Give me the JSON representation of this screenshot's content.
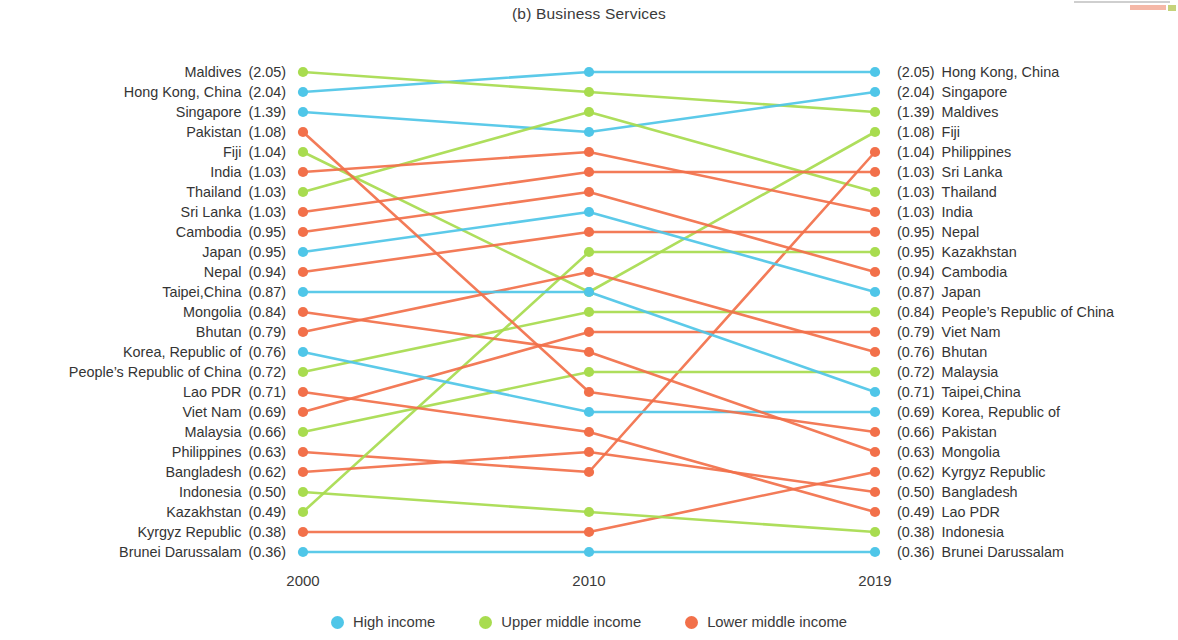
{
  "title": "(b) Business Services",
  "axis": {
    "years": [
      "2000",
      "2010",
      "2019"
    ],
    "x_positions": [
      303,
      589,
      875
    ]
  },
  "colors": {
    "high_income": "#4FC6E8",
    "upper_middle_income": "#A8DC4F",
    "lower_middle_income": "#F2704A",
    "text": "#3a3a3a"
  },
  "legend": {
    "items": [
      {
        "label": "High income",
        "color_key": "high_income",
        "dot_name": "legend-dot-high-income"
      },
      {
        "label": "Upper middle income",
        "color_key": "upper_middle_income",
        "dot_name": "legend-dot-upper-middle-income"
      },
      {
        "label": "Lower middle income",
        "color_key": "lower_middle_income",
        "dot_name": "legend-dot-lower-middle-income"
      }
    ]
  },
  "chart_data": {
    "type": "line",
    "chart_style": "slope-bump-chart",
    "title": "(b) Business Services",
    "xlabel": "",
    "ylabel": "",
    "categories": [
      "2000",
      "2010",
      "2019"
    ],
    "grid": false,
    "legend_position": "bottom",
    "y_axis": "rank order (1 = top row)",
    "left_column_header": "2000 value and economy",
    "right_column_header": "2019 value and economy",
    "left_rank_list": [
      {
        "rank": 1,
        "name": "Maldives",
        "value": "2.05",
        "group": "upper_middle_income"
      },
      {
        "rank": 2,
        "name": "Hong Kong, China",
        "value": "2.04",
        "group": "high_income"
      },
      {
        "rank": 3,
        "name": "Singapore",
        "value": "1.39",
        "group": "high_income"
      },
      {
        "rank": 4,
        "name": "Pakistan",
        "value": "1.08",
        "group": "lower_middle_income"
      },
      {
        "rank": 5,
        "name": "Fiji",
        "value": "1.04",
        "group": "upper_middle_income"
      },
      {
        "rank": 6,
        "name": "India",
        "value": "1.03",
        "group": "lower_middle_income"
      },
      {
        "rank": 7,
        "name": "Thailand",
        "value": "1.03",
        "group": "upper_middle_income"
      },
      {
        "rank": 8,
        "name": "Sri Lanka",
        "value": "1.03",
        "group": "lower_middle_income"
      },
      {
        "rank": 9,
        "name": "Cambodia",
        "value": "0.95",
        "group": "lower_middle_income"
      },
      {
        "rank": 10,
        "name": "Japan",
        "value": "0.95",
        "group": "high_income"
      },
      {
        "rank": 11,
        "name": "Nepal",
        "value": "0.94",
        "group": "lower_middle_income"
      },
      {
        "rank": 12,
        "name": "Taipei,China",
        "value": "0.87",
        "group": "high_income"
      },
      {
        "rank": 13,
        "name": "Mongolia",
        "value": "0.84",
        "group": "lower_middle_income"
      },
      {
        "rank": 14,
        "name": "Bhutan",
        "value": "0.79",
        "group": "lower_middle_income"
      },
      {
        "rank": 15,
        "name": "Korea, Republic of",
        "value": "0.76",
        "group": "high_income"
      },
      {
        "rank": 16,
        "name": "People’s Republic of China",
        "value": "0.72",
        "group": "upper_middle_income"
      },
      {
        "rank": 17,
        "name": "Lao PDR",
        "value": "0.71",
        "group": "lower_middle_income"
      },
      {
        "rank": 18,
        "name": "Viet Nam",
        "value": "0.69",
        "group": "lower_middle_income"
      },
      {
        "rank": 19,
        "name": "Malaysia",
        "value": "0.66",
        "group": "upper_middle_income"
      },
      {
        "rank": 20,
        "name": "Philippines",
        "value": "0.63",
        "group": "lower_middle_income"
      },
      {
        "rank": 21,
        "name": "Bangladesh",
        "value": "0.62",
        "group": "lower_middle_income"
      },
      {
        "rank": 22,
        "name": "Indonesia",
        "value": "0.50",
        "group": "upper_middle_income"
      },
      {
        "rank": 23,
        "name": "Kazakhstan",
        "value": "0.49",
        "group": "upper_middle_income"
      },
      {
        "rank": 24,
        "name": "Kyrgyz Republic",
        "value": "0.38",
        "group": "lower_middle_income"
      },
      {
        "rank": 25,
        "name": "Brunei Darussalam",
        "value": "0.36",
        "group": "high_income"
      }
    ],
    "right_rank_list": [
      {
        "rank": 1,
        "name": "Hong Kong, China",
        "value": "2.05",
        "group": "high_income"
      },
      {
        "rank": 2,
        "name": "Singapore",
        "value": "2.04",
        "group": "high_income"
      },
      {
        "rank": 3,
        "name": "Maldives",
        "value": "1.39",
        "group": "upper_middle_income"
      },
      {
        "rank": 4,
        "name": "Fiji",
        "value": "1.08",
        "group": "upper_middle_income"
      },
      {
        "rank": 5,
        "name": "Philippines",
        "value": "1.04",
        "group": "lower_middle_income"
      },
      {
        "rank": 6,
        "name": "Sri Lanka",
        "value": "1.03",
        "group": "lower_middle_income"
      },
      {
        "rank": 7,
        "name": "Thailand",
        "value": "1.03",
        "group": "upper_middle_income"
      },
      {
        "rank": 8,
        "name": "India",
        "value": "1.03",
        "group": "lower_middle_income"
      },
      {
        "rank": 9,
        "name": "Nepal",
        "value": "0.95",
        "group": "lower_middle_income"
      },
      {
        "rank": 10,
        "name": "Kazakhstan",
        "value": "0.95",
        "group": "upper_middle_income"
      },
      {
        "rank": 11,
        "name": "Cambodia",
        "value": "0.94",
        "group": "lower_middle_income"
      },
      {
        "rank": 12,
        "name": "Japan",
        "value": "0.87",
        "group": "high_income"
      },
      {
        "rank": 13,
        "name": "People’s Republic of China",
        "value": "0.84",
        "group": "upper_middle_income"
      },
      {
        "rank": 14,
        "name": "Viet Nam",
        "value": "0.79",
        "group": "lower_middle_income"
      },
      {
        "rank": 15,
        "name": "Bhutan",
        "value": "0.76",
        "group": "lower_middle_income"
      },
      {
        "rank": 16,
        "name": "Malaysia",
        "value": "0.72",
        "group": "upper_middle_income"
      },
      {
        "rank": 17,
        "name": "Taipei,China",
        "value": "0.71",
        "group": "high_income"
      },
      {
        "rank": 18,
        "name": "Korea, Republic of",
        "value": "0.69",
        "group": "high_income"
      },
      {
        "rank": 19,
        "name": "Pakistan",
        "value": "0.66",
        "group": "lower_middle_income"
      },
      {
        "rank": 20,
        "name": "Mongolia",
        "value": "0.63",
        "group": "lower_middle_income"
      },
      {
        "rank": 21,
        "name": "Kyrgyz Republic",
        "value": "0.62",
        "group": "lower_middle_income"
      },
      {
        "rank": 22,
        "name": "Bangladesh",
        "value": "0.50",
        "group": "lower_middle_income"
      },
      {
        "rank": 23,
        "name": "Lao PDR",
        "value": "0.49",
        "group": "lower_middle_income"
      },
      {
        "rank": 24,
        "name": "Indonesia",
        "value": "0.38",
        "group": "upper_middle_income"
      },
      {
        "rank": 25,
        "name": "Brunei Darussalam",
        "value": "0.36",
        "group": "high_income"
      }
    ],
    "series": [
      {
        "name": "Hong Kong, China",
        "group": "high_income",
        "ranks": [
          2,
          1,
          1
        ]
      },
      {
        "name": "Maldives",
        "group": "upper_middle_income",
        "ranks": [
          1,
          2,
          3
        ]
      },
      {
        "name": "Singapore",
        "group": "high_income",
        "ranks": [
          3,
          4,
          2
        ]
      },
      {
        "name": "Thailand",
        "group": "upper_middle_income",
        "ranks": [
          7,
          3,
          7
        ]
      },
      {
        "name": "Fiji",
        "group": "upper_middle_income",
        "ranks": [
          5,
          12,
          4
        ]
      },
      {
        "name": "Philippines",
        "group": "lower_middle_income",
        "ranks": [
          20,
          21,
          5
        ]
      },
      {
        "name": "Sri Lanka",
        "group": "lower_middle_income",
        "ranks": [
          8,
          6,
          6
        ]
      },
      {
        "name": "India",
        "group": "lower_middle_income",
        "ranks": [
          6,
          5,
          8
        ]
      },
      {
        "name": "Nepal",
        "group": "lower_middle_income",
        "ranks": [
          11,
          9,
          9
        ]
      },
      {
        "name": "Kazakhstan",
        "group": "upper_middle_income",
        "ranks": [
          23,
          10,
          10
        ]
      },
      {
        "name": "Cambodia",
        "group": "lower_middle_income",
        "ranks": [
          9,
          7,
          11
        ]
      },
      {
        "name": "Japan",
        "group": "high_income",
        "ranks": [
          10,
          8,
          12
        ]
      },
      {
        "name": "People’s Republic of China",
        "group": "upper_middle_income",
        "ranks": [
          16,
          13,
          13
        ]
      },
      {
        "name": "Viet Nam",
        "group": "lower_middle_income",
        "ranks": [
          18,
          14,
          14
        ]
      },
      {
        "name": "Bhutan",
        "group": "lower_middle_income",
        "ranks": [
          14,
          11,
          15
        ]
      },
      {
        "name": "Malaysia",
        "group": "upper_middle_income",
        "ranks": [
          19,
          16,
          16
        ]
      },
      {
        "name": "Taipei,China",
        "group": "high_income",
        "ranks": [
          12,
          12,
          17
        ]
      },
      {
        "name": "Korea, Republic of",
        "group": "high_income",
        "ranks": [
          15,
          18,
          18
        ]
      },
      {
        "name": "Pakistan",
        "group": "lower_middle_income",
        "ranks": [
          4,
          17,
          19
        ]
      },
      {
        "name": "Mongolia",
        "group": "lower_middle_income",
        "ranks": [
          13,
          15,
          20
        ]
      },
      {
        "name": "Kyrgyz Republic",
        "group": "lower_middle_income",
        "ranks": [
          24,
          24,
          21
        ]
      },
      {
        "name": "Bangladesh",
        "group": "lower_middle_income",
        "ranks": [
          21,
          20,
          22
        ]
      },
      {
        "name": "Lao PDR",
        "group": "lower_middle_income",
        "ranks": [
          17,
          19,
          23
        ]
      },
      {
        "name": "Indonesia",
        "group": "upper_middle_income",
        "ranks": [
          22,
          23,
          24
        ]
      },
      {
        "name": "Brunei Darussalam",
        "group": "high_income",
        "ranks": [
          25,
          25,
          25
        ]
      }
    ]
  }
}
